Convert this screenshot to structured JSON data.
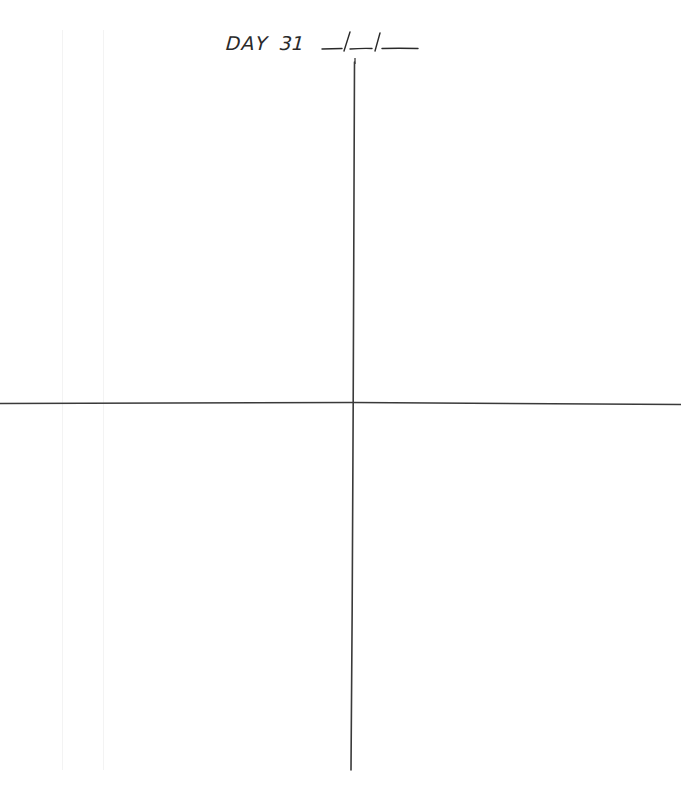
{
  "page": {
    "type": "journal-page",
    "background_color": "#ffffff",
    "ink_color": "#2a2a2a"
  },
  "header": {
    "day_label": "DAY",
    "day_number": "31",
    "date_placeholder": "__/__/__"
  },
  "layout": {
    "divider": "cross",
    "quadrants": [
      {
        "id": "top-left",
        "content": ""
      },
      {
        "id": "top-right",
        "content": ""
      },
      {
        "id": "bottom-left",
        "content": ""
      },
      {
        "id": "bottom-right",
        "content": ""
      }
    ]
  }
}
